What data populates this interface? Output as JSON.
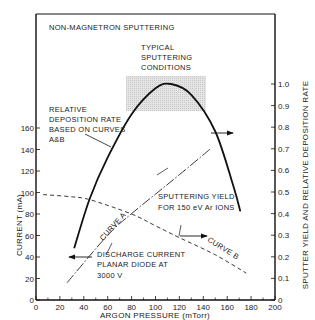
{
  "chart_data": {
    "type": "line",
    "title": "NON-MAGNETRON SPUTTERING",
    "xlabel": "ARGON PRESSURE (mTorr)",
    "ylabel_left": "CURRENT (mA)",
    "ylabel_right": "SPUTTER YIELD AND RELATIVE DEPOSITION RATE",
    "xlim": [
      0,
      200
    ],
    "ylim_left": [
      0,
      160
    ],
    "ylim_right": [
      0,
      1.0
    ],
    "x_ticks": [
      "0",
      "20",
      "40",
      "60",
      "80",
      "100",
      "120",
      "140",
      "160",
      "180",
      "200"
    ],
    "y_left_ticks": [
      "0",
      "20",
      "40",
      "60",
      "80",
      "100",
      "120",
      "140",
      "160"
    ],
    "y_right_ticks": [
      "0",
      "0.1",
      "0.2",
      "0.3",
      "0.4",
      "0.5",
      "0.6",
      "0.7",
      "0.8",
      "0.9",
      "1.0"
    ],
    "grid": false,
    "series": [
      {
        "name": "Relative deposition rate based on curves A&B",
        "style": "solid",
        "axis": "right",
        "x": [
          32,
          45,
          60,
          80,
          100,
          113,
          130,
          150,
          165,
          171
        ],
        "values": [
          0.24,
          0.47,
          0.66,
          0.86,
          0.98,
          1.0,
          0.95,
          0.78,
          0.53,
          0.41
        ]
      },
      {
        "name": "Curve A - Sputtering yield for 150 eV Ar ions",
        "style": "dash-dot",
        "axis": "right",
        "x": [
          26,
          60,
          80,
          100,
          120,
          146
        ],
        "values": [
          0.08,
          0.3,
          0.4,
          0.49,
          0.58,
          0.7
        ]
      },
      {
        "name": "Curve B - Discharge current planar diode at 3000 V",
        "style": "dashed",
        "axis": "left",
        "x": [
          6,
          30,
          46,
          80,
          100,
          120,
          150,
          176
        ],
        "values": [
          98,
          96,
          93,
          80,
          69,
          58,
          42,
          25
        ]
      }
    ],
    "annotations": [
      {
        "text": "TYPICAL SPUTTERING CONDITIONS",
        "region_x": [
          76,
          143
        ],
        "region_y_right": [
          0.88,
          1.04
        ]
      },
      {
        "text": "RELATIVE DEPOSITION RATE BASED ON CURVES A&B"
      },
      {
        "text": "SPUTTERING YIELD FOR 150 eV Ar IONS"
      },
      {
        "text": "DISCHARGE CURRENT PLANAR DIODE AT 3000 V"
      },
      {
        "text": "CURVE A"
      },
      {
        "text": "CURVE B"
      }
    ]
  },
  "labels": {
    "title": "NON-MAGNETRON SPUTTERING",
    "typical": [
      "TYPICAL",
      "SPUTTERING",
      "CONDITIONS"
    ],
    "deposition": [
      "RELATIVE",
      "DEPOSITION RATE",
      "BASED ON CURVES",
      "A&B"
    ],
    "yield": [
      "SPUTTERING YIELD",
      "FOR 150 eV Ar IONS"
    ],
    "discharge": [
      "DISCHARGE CURRENT",
      "PLANAR DIODE AT",
      "3000 V"
    ],
    "curve_a": "CURVE A",
    "curve_b": "CURVE B",
    "xlabel": "ARGON PRESSURE (mTorr)",
    "ylabel_left": "CURRENT (mA)",
    "ylabel_right": "SPUTTER YIELD AND RELATIVE DEPOSITION RATE"
  }
}
